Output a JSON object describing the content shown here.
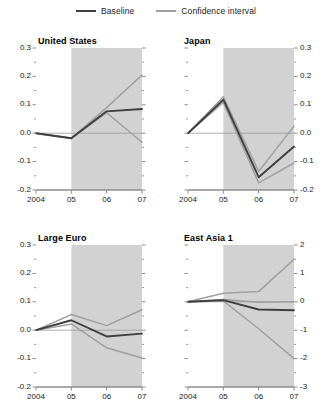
{
  "legend": {
    "items": [
      {
        "label": "Baseline",
        "color": "#3f3f3f"
      },
      {
        "label": "Confidence interval",
        "color": "#a0a0a0"
      }
    ]
  },
  "style": {
    "baseline_color": "#3f3f3f",
    "ci_color": "#a0a0a0",
    "shade_color": "#d2d2d2",
    "axis_color": "#8c8c8c",
    "zero_line_color": "#9a9a9a"
  },
  "chart_data": [
    {
      "type": "line",
      "title": "United States",
      "panel": "top-left",
      "xlabel": "",
      "ylabel": "",
      "x": [
        2004,
        2005,
        2006,
        2007
      ],
      "xticklabels": [
        "2004",
        "05",
        "06",
        "07"
      ],
      "ylim": [
        -0.2,
        0.3
      ],
      "yticks": [
        -0.2,
        -0.1,
        0.0,
        0.1,
        0.2,
        0.3
      ],
      "yticklabels": [
        "-0.2",
        "-0.1",
        "0.0",
        "0.1",
        "0.2",
        "0.3"
      ],
      "y_axis_side": "left",
      "minor_ticks": true,
      "grid": false,
      "zero_line": 0.0,
      "shaded_region": [
        2005,
        2007
      ],
      "legend_position": "figure-top-center",
      "series": [
        {
          "name": "Baseline",
          "kind": "baseline",
          "values": [
            0.0,
            -0.018,
            0.077,
            0.085
          ]
        },
        {
          "name": "Confidence interval upper",
          "kind": "ci",
          "values": [
            0.0,
            -0.018,
            0.09,
            0.205
          ]
        },
        {
          "name": "Confidence interval lower",
          "kind": "ci",
          "values": [
            0.0,
            -0.018,
            0.072,
            -0.032
          ]
        }
      ]
    },
    {
      "type": "line",
      "title": "Japan",
      "panel": "top-right",
      "xlabel": "",
      "ylabel": "",
      "x": [
        2004,
        2005,
        2006,
        2007
      ],
      "xticklabels": [
        "2004",
        "05",
        "06",
        "07"
      ],
      "ylim": [
        -0.2,
        0.3
      ],
      "yticks": [
        -0.2,
        -0.1,
        0.0,
        0.1,
        0.2,
        0.3
      ],
      "yticklabels": [
        "-0.2",
        "-0.1",
        "0.0",
        "0.1",
        "0.2",
        "0.3"
      ],
      "y_axis_side": "right",
      "minor_ticks": true,
      "grid": false,
      "zero_line": 0.0,
      "shaded_region": [
        2005,
        2007
      ],
      "series": [
        {
          "name": "Baseline",
          "kind": "baseline",
          "values": [
            0.0,
            0.118,
            -0.155,
            -0.047
          ]
        },
        {
          "name": "Confidence interval upper",
          "kind": "ci",
          "values": [
            0.0,
            0.128,
            -0.135,
            0.025
          ]
        },
        {
          "name": "Confidence interval lower",
          "kind": "ci",
          "values": [
            0.0,
            0.108,
            -0.175,
            -0.105
          ]
        }
      ]
    },
    {
      "type": "line",
      "title": "Large Euro",
      "panel": "bottom-left",
      "xlabel": "",
      "ylabel": "",
      "x": [
        2004,
        2005,
        2006,
        2007
      ],
      "xticklabels": [
        "2004",
        "05",
        "06",
        "07"
      ],
      "ylim": [
        -0.2,
        0.3
      ],
      "yticks": [
        -0.2,
        -0.1,
        0.0,
        0.1,
        0.2,
        0.3
      ],
      "yticklabels": [
        "-0.2",
        "-0.1",
        "0.0",
        "0.1",
        "0.2",
        "0.3"
      ],
      "y_axis_side": "left",
      "minor_ticks": true,
      "grid": false,
      "zero_line": 0.0,
      "shaded_region": [
        2005,
        2007
      ],
      "series": [
        {
          "name": "Baseline",
          "kind": "baseline",
          "values": [
            0.0,
            0.035,
            -0.022,
            -0.012
          ]
        },
        {
          "name": "Confidence interval upper",
          "kind": "ci",
          "values": [
            0.0,
            0.055,
            0.016,
            0.072
          ]
        },
        {
          "name": "Confidence interval lower",
          "kind": "ci",
          "values": [
            0.0,
            0.022,
            -0.062,
            -0.098
          ]
        }
      ]
    },
    {
      "type": "line",
      "title": "East Asia 1",
      "panel": "bottom-right",
      "xlabel": "",
      "ylabel": "",
      "x": [
        2004,
        2005,
        2006,
        2007
      ],
      "xticklabels": [
        "2004",
        "05",
        "06",
        "07"
      ],
      "ylim": [
        -3,
        2
      ],
      "yticks": [
        -3,
        -2,
        -1,
        0,
        1,
        2
      ],
      "yticklabels": [
        "-3",
        "-2",
        "-1",
        "0",
        "1",
        "2"
      ],
      "y_axis_side": "right",
      "minor_ticks": true,
      "grid": false,
      "zero_line": 0,
      "shaded_region": [
        2005,
        2007
      ],
      "series": [
        {
          "name": "Baseline",
          "kind": "baseline",
          "values": [
            0.0,
            0.06,
            -0.27,
            -0.3
          ]
        },
        {
          "name": "Confidence interval upper",
          "kind": "ci",
          "values": [
            0.0,
            0.3,
            0.36,
            1.5
          ]
        },
        {
          "name": "Confidence interval middle",
          "kind": "ci",
          "values": [
            0.0,
            0.08,
            -0.02,
            0.0
          ]
        },
        {
          "name": "Confidence interval lower",
          "kind": "ci",
          "values": [
            0.0,
            0.03,
            -0.95,
            -2.0
          ]
        }
      ]
    }
  ]
}
